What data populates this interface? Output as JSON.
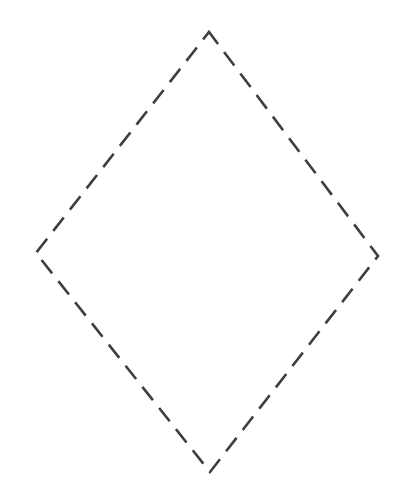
{
  "canvas": {
    "width": 410,
    "height": 500,
    "background_color": "#ffffff",
    "title": "Dashed Rhombus Outline"
  },
  "shape": {
    "name": "rhombus",
    "kind": "quadrilateral",
    "label": "Dashed rhombus outline",
    "closed": true,
    "fill": "none",
    "stroke_color": "#3d3d42",
    "stroke_width": 2.6,
    "stroke_style": "dashed",
    "dash_length": 17,
    "dash_gap": 10,
    "dash_array": "17 10",
    "dash_offset": 2,
    "vertices": [
      {
        "name": "top-vertex",
        "x": 209,
        "y": 32
      },
      {
        "name": "right-vertex",
        "x": 378,
        "y": 256
      },
      {
        "name": "bottom-vertex",
        "x": 210,
        "y": 472
      },
      {
        "name": "left-vertex",
        "x": 36,
        "y": 253
      }
    ],
    "points_attr": "209,32 378,256 210,472 36,253",
    "edges": [
      {
        "name": "top-right-edge",
        "from": "top-vertex",
        "to": "right-vertex"
      },
      {
        "name": "bottom-right-edge",
        "from": "right-vertex",
        "to": "bottom-vertex"
      },
      {
        "name": "bottom-left-edge",
        "from": "bottom-vertex",
        "to": "left-vertex"
      },
      {
        "name": "top-left-edge",
        "from": "left-vertex",
        "to": "top-vertex"
      }
    ],
    "bounding_box": {
      "x": 36,
      "y": 32,
      "width": 342,
      "height": 440
    }
  }
}
